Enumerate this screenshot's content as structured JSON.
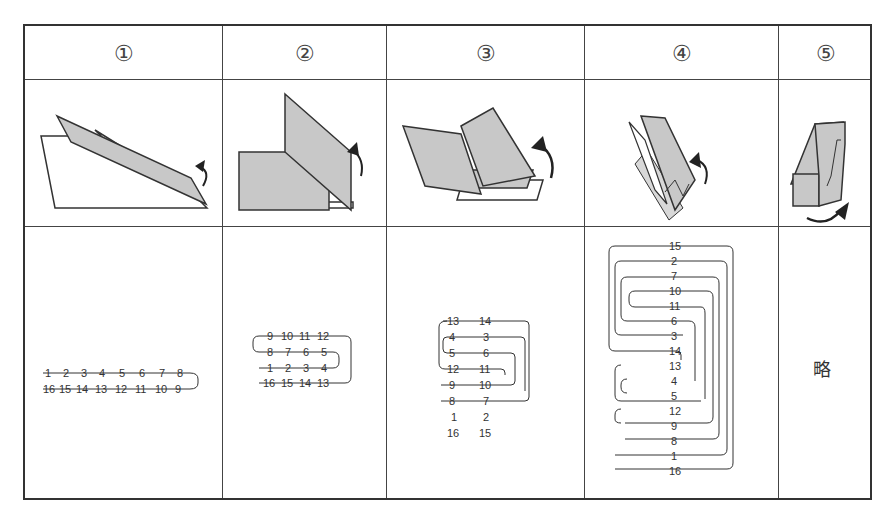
{
  "table": {
    "columns": [
      {
        "step": "①",
        "illustration": "paper-fold-1",
        "diagram": "1-row pair"
      },
      {
        "step": "②",
        "illustration": "paper-fold-2",
        "diagram": "4-row serpentine"
      },
      {
        "step": "③",
        "illustration": "paper-fold-3",
        "diagram": "8-row serpentine"
      },
      {
        "step": "④",
        "illustration": "paper-fold-4",
        "diagram": "16-row serpentine"
      },
      {
        "step": "⑤",
        "illustration": "paper-fold-5",
        "diagram": "略"
      }
    ]
  },
  "steps": {
    "s1": {
      "label": "①",
      "rows": [
        [
          "1",
          "2",
          "3",
          "4",
          "5",
          "6",
          "7",
          "8"
        ],
        [
          "16",
          "15",
          "14",
          "13",
          "12",
          "11",
          "10",
          "9"
        ]
      ]
    },
    "s2": {
      "label": "②",
      "rows": [
        [
          "9",
          "10",
          "11",
          "12"
        ],
        [
          "8",
          "7",
          "6",
          "5"
        ],
        [
          "1",
          "2",
          "3",
          "4"
        ],
        [
          "16",
          "15",
          "14",
          "13"
        ]
      ]
    },
    "s3": {
      "label": "③",
      "rows": [
        [
          "13",
          "14"
        ],
        [
          "4",
          "3"
        ],
        [
          "5",
          "6"
        ],
        [
          "12",
          "11"
        ],
        [
          "9",
          "10"
        ],
        [
          "8",
          "7"
        ],
        [
          "1",
          "2"
        ],
        [
          "16",
          "15"
        ]
      ]
    },
    "s4": {
      "label": "④",
      "rows": [
        "15",
        "2",
        "7",
        "10",
        "11",
        "6",
        "3",
        "14",
        "13",
        "4",
        "5",
        "12",
        "9",
        "8",
        "1",
        "16"
      ]
    },
    "s5": {
      "label": "⑤",
      "text": "略"
    }
  },
  "colors": {
    "fill": "#c8c8c8",
    "line": "#333333"
  }
}
